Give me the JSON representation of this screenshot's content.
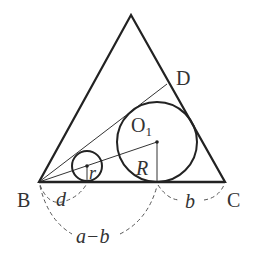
{
  "diagram": {
    "colors": {
      "stroke": "#222222",
      "thin": "#333333",
      "dash": "#555555",
      "label": "#333333",
      "background": "#ffffff"
    },
    "points": {
      "A": {
        "x": 131,
        "y": 15
      },
      "B": {
        "x": 39,
        "y": 182
      },
      "C": {
        "x": 225,
        "y": 182
      },
      "D": {
        "x": 167,
        "y": 84
      },
      "O1": {
        "x": 157,
        "y": 142
      },
      "o_small": {
        "x": 87,
        "y": 166
      }
    },
    "circles": {
      "big": {
        "cx": 157,
        "cy": 142,
        "r": 40
      },
      "small": {
        "cx": 87,
        "cy": 166,
        "r": 15
      }
    },
    "labels": {
      "B": "B",
      "C": "C",
      "D": "D",
      "O1": "O",
      "O1_sub": "1",
      "R": "R",
      "r": "r",
      "d": "d",
      "b": "b",
      "a_minus_b": "a−b"
    }
  }
}
